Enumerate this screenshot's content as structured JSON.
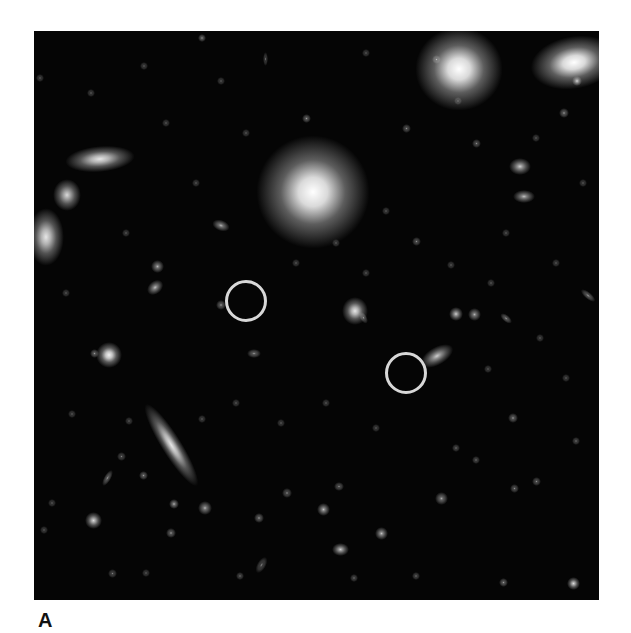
{
  "figure": {
    "panel_label": "A",
    "colors": {
      "background": "#050505",
      "marker": "#d8d8d8",
      "page": "#ffffff"
    },
    "markers": [
      {
        "id": "marker-1",
        "cx": 212,
        "cy": 270,
        "r": 21
      },
      {
        "id": "marker-2",
        "cx": 372,
        "cy": 342,
        "r": 21
      }
    ],
    "objects": [
      {
        "x": 253,
        "y": 135,
        "w": 52,
        "h": 52,
        "b": 1.0,
        "rot": 0
      },
      {
        "x": 405,
        "y": 19,
        "w": 40,
        "h": 38,
        "b": 1.0,
        "rot": 0
      },
      {
        "x": 520,
        "y": 19,
        "w": 40,
        "h": 24,
        "b": 1.0,
        "rot": -10
      },
      {
        "x": 50,
        "y": 122,
        "w": 32,
        "h": 12,
        "b": 0.9,
        "rot": -5
      },
      {
        "x": 25,
        "y": 155,
        "w": 16,
        "h": 18,
        "b": 0.85,
        "rot": 0
      },
      {
        "x": 4,
        "y": 193,
        "w": 16,
        "h": 26,
        "b": 0.9,
        "rot": 0
      },
      {
        "x": 68,
        "y": 317,
        "w": 14,
        "h": 14,
        "b": 0.95,
        "rot": 0
      },
      {
        "x": 115,
        "y": 409,
        "w": 44,
        "h": 9,
        "b": 0.9,
        "rot": 58
      },
      {
        "x": 314,
        "y": 272,
        "w": 14,
        "h": 16,
        "b": 0.9,
        "rot": 0
      },
      {
        "x": 393,
        "y": 320,
        "w": 20,
        "h": 10,
        "b": 0.8,
        "rot": -30
      },
      {
        "x": 480,
        "y": 131,
        "w": 12,
        "h": 9,
        "b": 0.8,
        "rot": 0
      },
      {
        "x": 484,
        "y": 162,
        "w": 12,
        "h": 7,
        "b": 0.75,
        "rot": 0
      },
      {
        "x": 116,
        "y": 253,
        "w": 10,
        "h": 7,
        "b": 0.75,
        "rot": -40
      },
      {
        "x": 120,
        "y": 232,
        "w": 7,
        "h": 7,
        "b": 0.7,
        "rot": 0
      },
      {
        "x": 182,
        "y": 191,
        "w": 10,
        "h": 6,
        "b": 0.7,
        "rot": 20
      },
      {
        "x": 216,
        "y": 320,
        "w": 8,
        "h": 5,
        "b": 0.6,
        "rot": 0
      },
      {
        "x": 270,
        "y": 85,
        "w": 5,
        "h": 5,
        "b": 0.6,
        "rot": 0
      },
      {
        "x": 540,
        "y": 47,
        "w": 6,
        "h": 6,
        "b": 0.8,
        "rot": 0
      },
      {
        "x": 400,
        "y": 26,
        "w": 5,
        "h": 5,
        "b": 0.6,
        "rot": 0
      },
      {
        "x": 166,
        "y": 5,
        "w": 4,
        "h": 4,
        "b": 0.6,
        "rot": 0
      },
      {
        "x": 58,
        "y": 320,
        "w": 5,
        "h": 5,
        "b": 0.6,
        "rot": 0
      },
      {
        "x": 184,
        "y": 271,
        "w": 6,
        "h": 6,
        "b": 0.6,
        "rot": 0
      },
      {
        "x": 326,
        "y": 285,
        "w": 7,
        "h": 4,
        "b": 0.55,
        "rot": 60
      },
      {
        "x": 418,
        "y": 279,
        "w": 8,
        "h": 8,
        "b": 0.8,
        "rot": 0
      },
      {
        "x": 437,
        "y": 280,
        "w": 7,
        "h": 7,
        "b": 0.7,
        "rot": 0
      },
      {
        "x": 468,
        "y": 286,
        "w": 8,
        "h": 4,
        "b": 0.6,
        "rot": 40
      },
      {
        "x": 549,
        "y": 263,
        "w": 10,
        "h": 4,
        "b": 0.6,
        "rot": 40
      },
      {
        "x": 527,
        "y": 79,
        "w": 6,
        "h": 6,
        "b": 0.6,
        "rot": 0
      },
      {
        "x": 55,
        "y": 485,
        "w": 9,
        "h": 9,
        "b": 0.85,
        "rot": 0
      },
      {
        "x": 137,
        "y": 470,
        "w": 6,
        "h": 6,
        "b": 0.7,
        "rot": 0
      },
      {
        "x": 167,
        "y": 473,
        "w": 8,
        "h": 8,
        "b": 0.7,
        "rot": 0
      },
      {
        "x": 134,
        "y": 499,
        "w": 6,
        "h": 6,
        "b": 0.6,
        "rot": 0
      },
      {
        "x": 222,
        "y": 484,
        "w": 6,
        "h": 6,
        "b": 0.6,
        "rot": 0
      },
      {
        "x": 286,
        "y": 475,
        "w": 7,
        "h": 7,
        "b": 0.75,
        "rot": 0
      },
      {
        "x": 250,
        "y": 459,
        "w": 6,
        "h": 6,
        "b": 0.55,
        "rot": 0
      },
      {
        "x": 302,
        "y": 453,
        "w": 6,
        "h": 5,
        "b": 0.55,
        "rot": 0
      },
      {
        "x": 344,
        "y": 499,
        "w": 7,
        "h": 7,
        "b": 0.75,
        "rot": 0
      },
      {
        "x": 302,
        "y": 515,
        "w": 9,
        "h": 7,
        "b": 0.8,
        "rot": 0
      },
      {
        "x": 404,
        "y": 464,
        "w": 7,
        "h": 7,
        "b": 0.65,
        "rot": 0
      },
      {
        "x": 476,
        "y": 384,
        "w": 6,
        "h": 6,
        "b": 0.6,
        "rot": 0
      },
      {
        "x": 536,
        "y": 549,
        "w": 7,
        "h": 7,
        "b": 0.85,
        "rot": 0
      },
      {
        "x": 467,
        "y": 549,
        "w": 5,
        "h": 5,
        "b": 0.6,
        "rot": 0
      },
      {
        "x": 72,
        "y": 442,
        "w": 4,
        "h": 10,
        "b": 0.6,
        "rot": 30
      },
      {
        "x": 107,
        "y": 442,
        "w": 5,
        "h": 5,
        "b": 0.6,
        "rot": 0
      },
      {
        "x": 85,
        "y": 423,
        "w": 5,
        "h": 5,
        "b": 0.5,
        "rot": 0
      },
      {
        "x": 225,
        "y": 529,
        "w": 5,
        "h": 10,
        "b": 0.5,
        "rot": 30
      },
      {
        "x": 76,
        "y": 540,
        "w": 5,
        "h": 5,
        "b": 0.5,
        "rot": 0
      },
      {
        "x": 204,
        "y": 543,
        "w": 4,
        "h": 4,
        "b": 0.5,
        "rot": 0
      },
      {
        "x": 318,
        "y": 545,
        "w": 4,
        "h": 4,
        "b": 0.5,
        "rot": 0
      },
      {
        "x": 380,
        "y": 543,
        "w": 4,
        "h": 4,
        "b": 0.5,
        "rot": 0
      },
      {
        "x": 420,
        "y": 415,
        "w": 4,
        "h": 4,
        "b": 0.5,
        "rot": 0
      },
      {
        "x": 440,
        "y": 427,
        "w": 4,
        "h": 4,
        "b": 0.5,
        "rot": 0
      },
      {
        "x": 478,
        "y": 455,
        "w": 5,
        "h": 5,
        "b": 0.55,
        "rot": 0
      },
      {
        "x": 500,
        "y": 448,
        "w": 5,
        "h": 5,
        "b": 0.55,
        "rot": 0
      },
      {
        "x": 540,
        "y": 408,
        "w": 4,
        "h": 4,
        "b": 0.5,
        "rot": 0
      },
      {
        "x": 110,
        "y": 540,
        "w": 4,
        "h": 4,
        "b": 0.45,
        "rot": 0
      },
      {
        "x": 16,
        "y": 470,
        "w": 4,
        "h": 4,
        "b": 0.45,
        "rot": 0
      },
      {
        "x": 8,
        "y": 497,
        "w": 4,
        "h": 4,
        "b": 0.45,
        "rot": 0
      },
      {
        "x": 36,
        "y": 381,
        "w": 4,
        "h": 4,
        "b": 0.45,
        "rot": 0
      },
      {
        "x": 93,
        "y": 388,
        "w": 4,
        "h": 4,
        "b": 0.45,
        "rot": 0
      },
      {
        "x": 166,
        "y": 386,
        "w": 4,
        "h": 4,
        "b": 0.45,
        "rot": 0
      },
      {
        "x": 200,
        "y": 370,
        "w": 4,
        "h": 4,
        "b": 0.45,
        "rot": 0
      },
      {
        "x": 245,
        "y": 390,
        "w": 4,
        "h": 4,
        "b": 0.45,
        "rot": 0
      },
      {
        "x": 290,
        "y": 370,
        "w": 4,
        "h": 4,
        "b": 0.45,
        "rot": 0
      },
      {
        "x": 340,
        "y": 395,
        "w": 4,
        "h": 4,
        "b": 0.45,
        "rot": 0
      },
      {
        "x": 452,
        "y": 336,
        "w": 4,
        "h": 4,
        "b": 0.45,
        "rot": 0
      },
      {
        "x": 504,
        "y": 305,
        "w": 4,
        "h": 4,
        "b": 0.45,
        "rot": 0
      },
      {
        "x": 530,
        "y": 345,
        "w": 4,
        "h": 4,
        "b": 0.45,
        "rot": 0
      },
      {
        "x": 415,
        "y": 232,
        "w": 4,
        "h": 4,
        "b": 0.45,
        "rot": 0
      },
      {
        "x": 455,
        "y": 250,
        "w": 4,
        "h": 4,
        "b": 0.45,
        "rot": 0
      },
      {
        "x": 380,
        "y": 208,
        "w": 5,
        "h": 5,
        "b": 0.55,
        "rot": 0
      },
      {
        "x": 350,
        "y": 178,
        "w": 4,
        "h": 4,
        "b": 0.45,
        "rot": 0
      },
      {
        "x": 440,
        "y": 110,
        "w": 5,
        "h": 5,
        "b": 0.55,
        "rot": 0
      },
      {
        "x": 370,
        "y": 95,
        "w": 5,
        "h": 5,
        "b": 0.55,
        "rot": 0
      },
      {
        "x": 422,
        "y": 68,
        "w": 4,
        "h": 4,
        "b": 0.45,
        "rot": 0
      },
      {
        "x": 108,
        "y": 33,
        "w": 4,
        "h": 4,
        "b": 0.45,
        "rot": 0
      },
      {
        "x": 185,
        "y": 48,
        "w": 4,
        "h": 4,
        "b": 0.45,
        "rot": 0
      },
      {
        "x": 4,
        "y": 45,
        "w": 4,
        "h": 4,
        "b": 0.45,
        "rot": 0
      },
      {
        "x": 130,
        "y": 90,
        "w": 4,
        "h": 4,
        "b": 0.45,
        "rot": 0
      },
      {
        "x": 210,
        "y": 100,
        "w": 4,
        "h": 4,
        "b": 0.45,
        "rot": 0
      },
      {
        "x": 160,
        "y": 150,
        "w": 4,
        "h": 4,
        "b": 0.45,
        "rot": 0
      },
      {
        "x": 90,
        "y": 200,
        "w": 4,
        "h": 4,
        "b": 0.45,
        "rot": 0
      },
      {
        "x": 30,
        "y": 260,
        "w": 4,
        "h": 4,
        "b": 0.45,
        "rot": 0
      },
      {
        "x": 260,
        "y": 230,
        "w": 4,
        "h": 4,
        "b": 0.45,
        "rot": 0
      },
      {
        "x": 300,
        "y": 210,
        "w": 4,
        "h": 4,
        "b": 0.45,
        "rot": 0
      },
      {
        "x": 330,
        "y": 240,
        "w": 4,
        "h": 4,
        "b": 0.45,
        "rot": 0
      },
      {
        "x": 470,
        "y": 200,
        "w": 4,
        "h": 4,
        "b": 0.45,
        "rot": 0
      },
      {
        "x": 520,
        "y": 230,
        "w": 4,
        "h": 4,
        "b": 0.45,
        "rot": 0
      },
      {
        "x": 547,
        "y": 150,
        "w": 4,
        "h": 4,
        "b": 0.45,
        "rot": 0
      },
      {
        "x": 500,
        "y": 105,
        "w": 4,
        "h": 4,
        "b": 0.45,
        "rot": 0
      },
      {
        "x": 330,
        "y": 20,
        "w": 4,
        "h": 4,
        "b": 0.45,
        "rot": 0
      },
      {
        "x": 230,
        "y": 24,
        "w": 3,
        "h": 8,
        "b": 0.45,
        "rot": 0
      },
      {
        "x": 55,
        "y": 60,
        "w": 4,
        "h": 4,
        "b": 0.45,
        "rot": 0
      }
    ]
  }
}
